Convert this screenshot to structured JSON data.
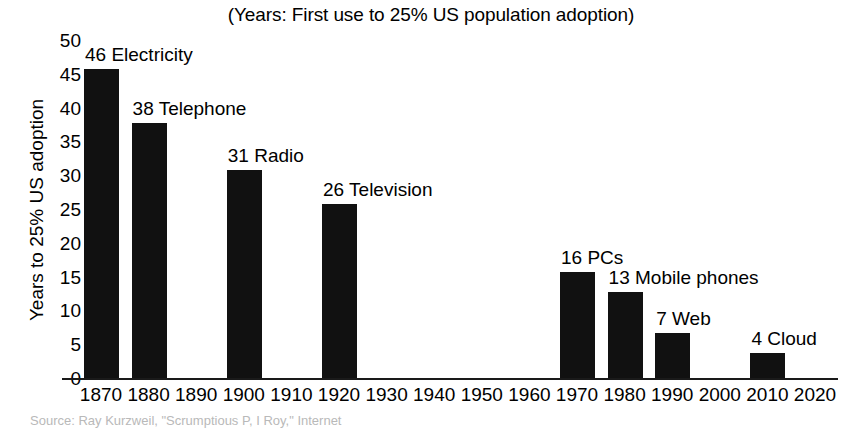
{
  "chart_data": {
    "type": "bar",
    "title": "(Years: First use to 25% US population adoption)",
    "xlabel": "",
    "ylabel": "Years to 25% US adoption",
    "ylim": [
      0,
      50
    ],
    "ytick_step": 5,
    "xlim": [
      1870,
      2020
    ],
    "grid": false,
    "legend": null,
    "bar_color": "#111111",
    "axis_color": "#1a1a1a",
    "background_color": "#ffffff",
    "yticks": [
      "50",
      "45",
      "40",
      "35",
      "30",
      "25",
      "20",
      "15",
      "10",
      "5",
      "0"
    ],
    "xticks": [
      "1870",
      "1880",
      "1890",
      "1900",
      "1910",
      "1920",
      "1930",
      "1940",
      "1950",
      "1960",
      "1970",
      "1980",
      "1990",
      "2000",
      "2010",
      "2020"
    ],
    "categories": [
      "Electricity",
      "Telephone",
      "Radio",
      "Television",
      "PCs",
      "Mobile phones",
      "Web",
      "Cloud"
    ],
    "values": [
      46,
      38,
      31,
      26,
      16,
      13,
      7,
      4
    ],
    "x": [
      1870,
      1880,
      1900,
      1920,
      1970,
      1980,
      1990,
      2010
    ],
    "points": [
      {
        "x": 1870,
        "value": 46,
        "label": "46 Electricity"
      },
      {
        "x": 1880,
        "value": 38,
        "label": "38 Telephone"
      },
      {
        "x": 1900,
        "value": 31,
        "label": "31 Radio"
      },
      {
        "x": 1920,
        "value": 26,
        "label": "26 Television"
      },
      {
        "x": 1970,
        "value": 16,
        "label": "16 PCs"
      },
      {
        "x": 1980,
        "value": 13,
        "label": "13 Mobile phones"
      },
      {
        "x": 1990,
        "value": 7,
        "label": "7 Web"
      },
      {
        "x": 2010,
        "value": 4,
        "label": "4 Cloud"
      }
    ]
  },
  "source_note": "Source: Ray Kurzweil, \"Scrumptious P, I Roy,\" Internet"
}
